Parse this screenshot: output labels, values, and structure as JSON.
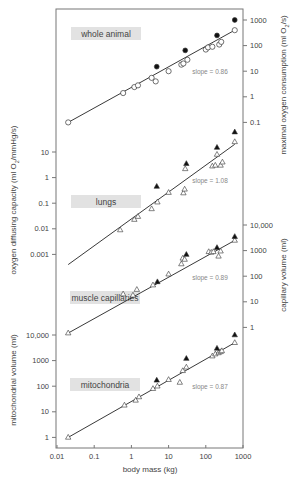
{
  "chart_data": {
    "type": "scatter",
    "xlabel": "body mass (kg)",
    "x_scale": "log",
    "xlim": [
      0.01,
      1000
    ],
    "x_ticks": [
      "0.01",
      "0.1",
      "1",
      "10",
      "100",
      "1000"
    ],
    "panels": [
      {
        "name": "whole animal",
        "ylabel": "maximal oxygen consumption (ml O2/s)",
        "y_axis_side": "right",
        "y_ticks": [
          "1000",
          "100",
          "10",
          "1",
          "0.1"
        ],
        "slope_label": "slope = 0.86",
        "open_marker": "circle",
        "filled_marker": "circle",
        "series": [
          {
            "name": "open",
            "points": [
              [
                0.02,
                0.1
              ],
              [
                0.6,
                1.4
              ],
              [
                1.2,
                2.4
              ],
              [
                1.5,
                2.8
              ],
              [
                3.5,
                5.5
              ],
              [
                4.5,
                4.0
              ],
              [
                10,
                10
              ],
              [
                22,
                18
              ],
              [
                25,
                20
              ],
              [
                32,
                28
              ],
              [
                100,
                70
              ],
              [
                115,
                85
              ],
              [
                150,
                90
              ],
              [
                230,
                110
              ],
              [
                260,
                140
              ],
              [
                600,
                400
              ]
            ]
          },
          {
            "name": "filled",
            "points": [
              [
                4.8,
                15
              ],
              [
                28,
                65
              ],
              [
                200,
                250
              ],
              [
                600,
                1000
              ]
            ]
          }
        ],
        "fit_line": {
          "x": [
            0.02,
            600
          ],
          "y": [
            0.1,
            400
          ]
        }
      },
      {
        "name": "lungs",
        "ylabel": "oxygen diffusing capacity (ml O2/mmHg/s)",
        "y_axis_side": "left",
        "y_ticks": [
          "10",
          "1",
          "0.1",
          "0.01",
          "0.001"
        ],
        "slope_label": "slope = 1.08",
        "open_marker": "triangle",
        "filled_marker": "triangle",
        "series": [
          {
            "name": "open",
            "points": [
              [
                0.5,
                0.009
              ],
              [
                1.2,
                0.023
              ],
              [
                1.5,
                0.03
              ],
              [
                3.5,
                0.06
              ],
              [
                5,
                0.11
              ],
              [
                10,
                0.26
              ],
              [
                25,
                0.25
              ],
              [
                27,
                0.35
              ],
              [
                28,
                2.2
              ],
              [
                150,
                2.8
              ],
              [
                180,
                3.0
              ],
              [
                200,
                8
              ],
              [
                250,
                3.0
              ],
              [
                280,
                4
              ],
              [
                600,
                25
              ]
            ]
          },
          {
            "name": "filled",
            "points": [
              [
                4.8,
                0.45
              ],
              [
                30,
                3.5
              ],
              [
                200,
                15
              ],
              [
                600,
                60
              ]
            ]
          }
        ],
        "fit_line": {
          "x": [
            0.02,
            600
          ],
          "y": [
            0.0004,
            20
          ]
        }
      },
      {
        "name": "muscle capillaries",
        "ylabel": "capillary volume (ml)",
        "y_axis_side": "right",
        "y_ticks": [
          "10,000",
          "1000",
          "100",
          "10",
          "1"
        ],
        "slope_label": "slope = 0.89",
        "open_marker": "triangle",
        "filled_marker": "triangle",
        "series": [
          {
            "name": "open",
            "points": [
              [
                0.02,
                0.6
              ],
              [
                0.6,
                20
              ],
              [
                1.1,
                18
              ],
              [
                1.4,
                30
              ],
              [
                3.8,
                45
              ],
              [
                10,
                120
              ],
              [
                22,
                300
              ],
              [
                24,
                500
              ],
              [
                27,
                450
              ],
              [
                120,
                900
              ],
              [
                140,
                850
              ],
              [
                160,
                900
              ],
              [
                220,
                600
              ],
              [
                250,
                950
              ],
              [
                600,
                2500
              ]
            ]
          },
          {
            "name": "filled",
            "points": [
              [
                5,
                60
              ],
              [
                30,
                700
              ],
              [
                200,
                1300
              ],
              [
                600,
                3500
              ]
            ]
          }
        ],
        "fit_line": {
          "x": [
            0.02,
            600
          ],
          "y": [
            0.6,
            2500
          ]
        }
      },
      {
        "name": "mitochondria",
        "ylabel": "mitochondrial volume (ml)",
        "y_axis_side": "left",
        "y_ticks": [
          "10,000",
          "1000",
          "100",
          "10",
          "1"
        ],
        "slope_label": "slope = 0.87",
        "open_marker": "triangle",
        "filled_marker": "triangle",
        "series": [
          {
            "name": "open",
            "points": [
              [
                0.02,
                1
              ],
              [
                0.65,
                18
              ],
              [
                1.3,
                28
              ],
              [
                1.6,
                38
              ],
              [
                3.8,
                80
              ],
              [
                5,
                100
              ],
              [
                10,
                180
              ],
              [
                20,
                140
              ],
              [
                24,
                400
              ],
              [
                30,
                550
              ],
              [
                150,
                1500
              ],
              [
                180,
                1800
              ],
              [
                220,
                2000
              ],
              [
                250,
                2200
              ],
              [
                270,
                2400
              ],
              [
                600,
                5000
              ]
            ]
          },
          {
            "name": "filled",
            "points": [
              [
                4.8,
                170
              ],
              [
                30,
                1200
              ],
              [
                200,
                3000
              ],
              [
                600,
                10000
              ]
            ]
          }
        ],
        "fit_line": {
          "x": [
            0.02,
            600
          ],
          "y": [
            1,
            5000
          ]
        }
      }
    ]
  }
}
